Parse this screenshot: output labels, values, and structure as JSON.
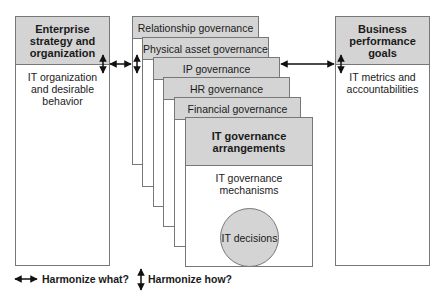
{
  "left_box": {
    "title": "Enterprise strategy and organization",
    "body": "IT organization and desirable behavior"
  },
  "right_box": {
    "title": "Business performance goals",
    "body": "IT metrics and accountabilities"
  },
  "cards": [
    {
      "label": "Relationship governance"
    },
    {
      "label": "Physical asset governance"
    },
    {
      "label": "IP governance"
    },
    {
      "label": "HR governance"
    },
    {
      "label": "Financial governance"
    }
  ],
  "front_card": {
    "title": "IT governance arrangements",
    "body": "IT governance mechanisms",
    "circle": "IT decisions"
  },
  "legend": {
    "horizontal": "Harmonize what?",
    "vertical": "Harmonize how?"
  },
  "colors": {
    "header_fill": "#d4d4d4",
    "border": "#777777",
    "arrow": "#111111"
  }
}
